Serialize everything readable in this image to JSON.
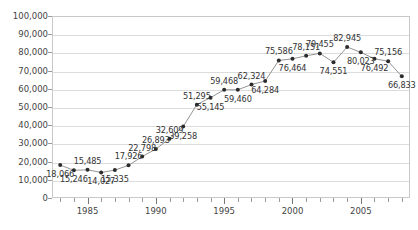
{
  "chart_data": {
    "type": "line",
    "title": "",
    "xlabel": "",
    "ylabel": "",
    "xlim": [
      1982.4,
      2008.6
    ],
    "ylim": [
      0,
      100000
    ],
    "grid": true,
    "legend": false,
    "y_ticks": [
      0,
      10000,
      20000,
      30000,
      40000,
      50000,
      60000,
      70000,
      80000,
      90000,
      100000
    ],
    "y_tick_labels": [
      "0",
      "10,000",
      "20,000",
      "30,000",
      "40,000",
      "50,000",
      "60,000",
      "70,000",
      "80,000",
      "90,000",
      "100,000"
    ],
    "x_ticks_major": [
      1985,
      1990,
      1995,
      2000,
      2005
    ],
    "x_tick_labels": [
      "1985",
      "1990",
      "1995",
      "2000",
      "2005"
    ],
    "x": [
      1983,
      1984,
      1985,
      1986,
      1987,
      1988,
      1989,
      1990,
      1991,
      1992,
      1993,
      1994,
      1995,
      1996,
      1997,
      1998,
      1999,
      2000,
      2001,
      2002,
      2003,
      2004,
      2005,
      2006,
      2007,
      2008
    ],
    "values": [
      18066,
      15246,
      15485,
      14027,
      15335,
      17926,
      22798,
      26893,
      32609,
      39258,
      51295,
      55145,
      59468,
      59460,
      62324,
      64284,
      75586,
      76464,
      78151,
      79455,
      74551,
      82945,
      80023,
      76492,
      75156,
      66833
    ],
    "point_labels": [
      "18,066",
      "15,246",
      "15,485",
      "14,027",
      "15,335",
      "17,926",
      "22,798",
      "26,893",
      "32,609",
      "39,258",
      "51,295",
      "55,145",
      "59,468",
      "59,460",
      "62,324",
      "64,284",
      "75,586",
      "76,464",
      "78,151",
      "79,455",
      "74,551",
      "82,945",
      "80,023",
      "76,492",
      "75,156",
      "66,833"
    ],
    "label_positions": [
      "below",
      "below",
      "above",
      "below",
      "below",
      "above",
      "above",
      "above",
      "above",
      "below",
      "above",
      "below",
      "above",
      "below",
      "above",
      "below",
      "above",
      "below",
      "above",
      "above",
      "below",
      "above",
      "below",
      "below",
      "above",
      "below"
    ],
    "series_color": "#888888",
    "marker_color": "#2b2b2b",
    "grid_color": "#dcdcdc",
    "axis_color": "#c9c9c9"
  }
}
